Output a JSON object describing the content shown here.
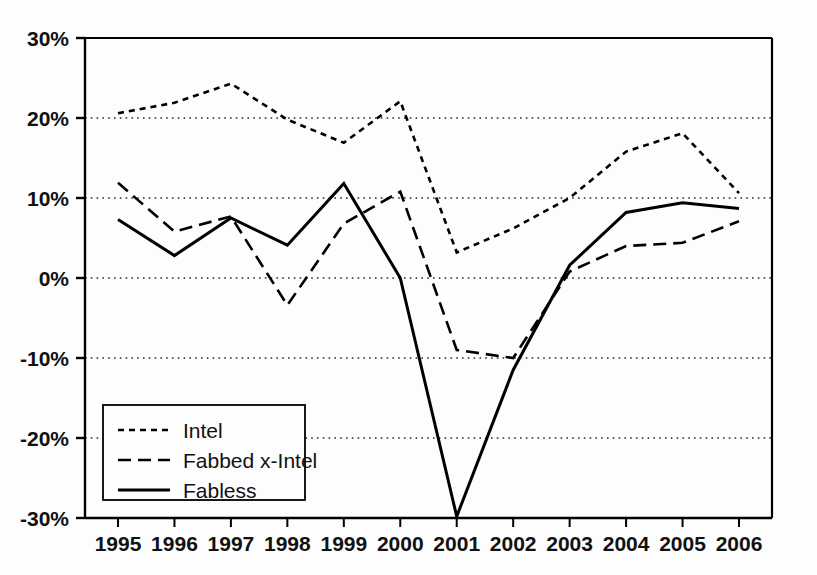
{
  "chart_data": {
    "type": "line",
    "title": "",
    "subtitle": "",
    "xlabel": "",
    "ylabel": "",
    "categories": [
      "1995",
      "1996",
      "1997",
      "1998",
      "1999",
      "2000",
      "2001",
      "2002",
      "2003",
      "2004",
      "2005",
      "2006"
    ],
    "x": [
      1995,
      1996,
      1997,
      1998,
      1999,
      2000,
      2001,
      2002,
      2003,
      2004,
      2005,
      2006
    ],
    "ylim": [
      -30,
      30
    ],
    "xlim": [
      1995,
      2006
    ],
    "y_tick_labels": [
      "30%",
      "20%",
      "10%",
      "0%",
      "-10%",
      "-20%",
      "-30%"
    ],
    "y_ticks": [
      30,
      20,
      10,
      0,
      -10,
      -20,
      -30
    ],
    "grid": true,
    "grid_axis": "y",
    "grid_style": "dotted",
    "legend_position": "bottom-left",
    "units": "percent",
    "series": [
      {
        "name": "Intel",
        "style": "dotted",
        "color": "#000000",
        "values": [
          20.6,
          21.9,
          24.3,
          19.8,
          16.9,
          22.1,
          3.2,
          6.2,
          10.0,
          15.8,
          18.1,
          10.6
        ]
      },
      {
        "name": "Fabbed x-Intel",
        "style": "dashed",
        "color": "#000000",
        "values": [
          11.9,
          5.8,
          7.7,
          -3.4,
          6.8,
          10.8,
          -9.0,
          -10.0,
          0.8,
          4.0,
          4.4,
          7.1
        ]
      },
      {
        "name": "Fabless",
        "style": "solid",
        "color": "#000000",
        "values": [
          7.3,
          2.8,
          7.5,
          4.1,
          11.8,
          0.0,
          -29.8,
          -11.5,
          1.6,
          8.2,
          9.4,
          8.7
        ]
      }
    ]
  },
  "legend": {
    "items": [
      {
        "label": "Intel",
        "style": "dotted"
      },
      {
        "label": "Fabbed x-Intel",
        "style": "dashed"
      },
      {
        "label": "Fabless",
        "style": "solid"
      }
    ]
  },
  "axes": {
    "y_labels": [
      "30%",
      "20%",
      "10%",
      "0%",
      "-10%",
      "-20%",
      "-30%"
    ],
    "x_labels": [
      "1995",
      "1996",
      "1997",
      "1998",
      "1999",
      "2000",
      "2001",
      "2002",
      "2003",
      "2004",
      "2005",
      "2006"
    ]
  }
}
